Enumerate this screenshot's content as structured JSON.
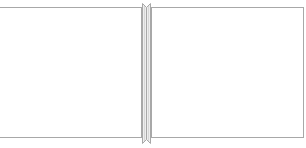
{
  "layout": {
    "type": "split-pane",
    "orientation": "horizontal",
    "panes": [
      {
        "id": "left",
        "content": ""
      },
      {
        "id": "right",
        "content": ""
      }
    ]
  },
  "colors": {
    "border": "#a8a8a8",
    "splitter_fill": "#e8e8e8",
    "background": "#ffffff"
  },
  "splitter": {
    "icon": "splitter-handle-icon"
  }
}
